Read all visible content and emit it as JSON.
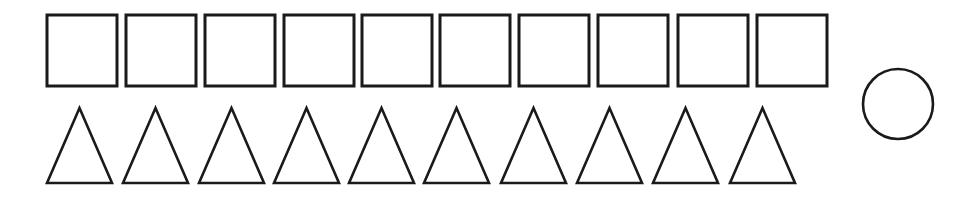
{
  "figure": {
    "stroke_color": "#1a1a1a",
    "fill_color": "#ffffff",
    "squares": {
      "count": 10,
      "x": [
        47,
        126,
        205,
        284,
        362,
        440,
        519,
        598,
        678,
        757
      ],
      "y": 15,
      "width": 70,
      "height": 71
    },
    "triangles": {
      "count": 10,
      "left_x": [
        47,
        123,
        199,
        274,
        349,
        424,
        501,
        577,
        653,
        730
      ],
      "apex_y": 108,
      "base_y": 183,
      "width": 65
    },
    "circle": {
      "count": 1,
      "cx": 898,
      "cy": 104,
      "r": 35
    }
  }
}
